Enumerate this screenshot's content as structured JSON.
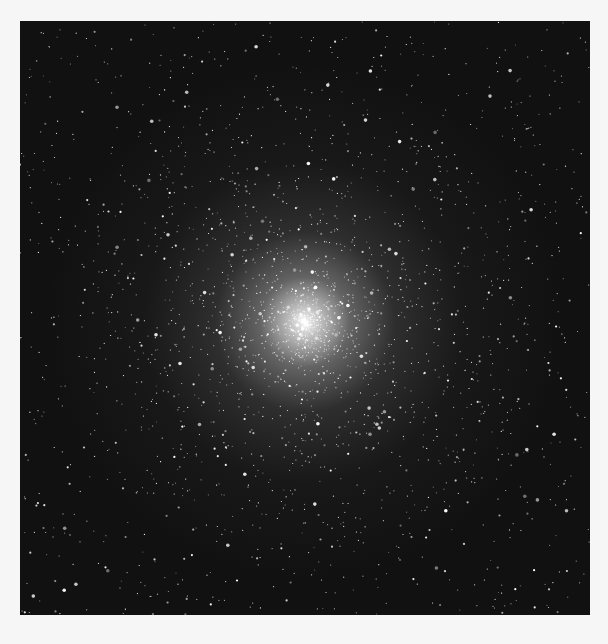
{
  "image": {
    "subject": "globular star cluster",
    "frame_color": "#111111",
    "background_color": "#f6f6f6",
    "core_position": {
      "x": 305,
      "y": 322
    }
  }
}
